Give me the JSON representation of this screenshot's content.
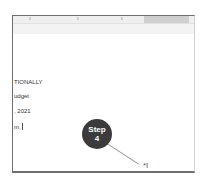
{
  "ruler": {
    "ticks": [
      "4",
      "5",
      "6"
    ]
  },
  "document": {
    "lines": [
      "TIONALLY",
      "udget",
      ", 2021",
      "m."
    ]
  },
  "callout": {
    "line1": "Step",
    "line2": "4"
  },
  "cursor": {
    "glyph": "*I"
  }
}
